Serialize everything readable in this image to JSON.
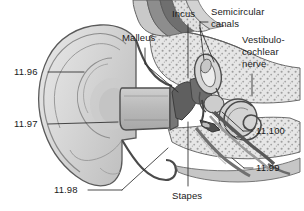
{
  "figure": {
    "type": "anatomical-illustration",
    "background_color": "#ffffff",
    "line_color": "#4a4a4a",
    "text_color": "#1a1a1a"
  },
  "labels": {
    "malleus": "Malleus",
    "incus": "Incus",
    "semicircular_canals_line1": "Semicircular",
    "semicircular_canals_line2": "canals",
    "vestibulocochlear_line1": "Vestibulo-",
    "vestibulocochlear_line2": "cochlear",
    "vestibulocochlear_line3": "nerve",
    "stapes": "Stapes",
    "num_11_96": "11.96",
    "num_11_97": "11.97",
    "num_11_98": "11.98",
    "num_11_99": "11.99",
    "num_11_100": "11.100"
  }
}
